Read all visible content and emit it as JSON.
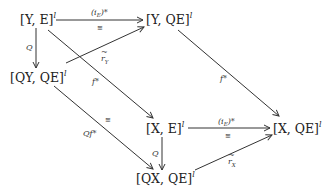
{
  "nodes": {
    "YE": {
      "base": "[Y, E]",
      "sup": "l"
    },
    "YQE": {
      "base": "[Y, QE]",
      "sup": "l"
    },
    "QYQE": {
      "base": "[QY, QE]",
      "sup": "l"
    },
    "XE": {
      "base": "[X, E]",
      "sup": "l"
    },
    "XQE": {
      "base": "[X, QE]",
      "sup": "l"
    },
    "QXQE": {
      "base": "[QX, QE]",
      "sup": "l"
    }
  },
  "edges": {
    "top_horizontal": {
      "label": "(i",
      "label_sub": "E",
      "label_suffix": ")*",
      "iso": "≅"
    },
    "left_vertical": {
      "label": "Q"
    },
    "r_y": {
      "label": "r",
      "label_sup": "~",
      "label_sub": "Y"
    },
    "f_star_left": {
      "label": "f*"
    },
    "f_star_right": {
      "label": "f*"
    },
    "qf_star": {
      "label": "Qf*",
      "iso": "≅"
    },
    "bottom_horizontal": {
      "label": "(i",
      "label_sub": "E",
      "label_suffix": ")*",
      "iso": "≅"
    },
    "right_vertical": {
      "label": "Q"
    },
    "r_x": {
      "label": "r",
      "label_sup": "~",
      "label_sub": "X"
    }
  }
}
